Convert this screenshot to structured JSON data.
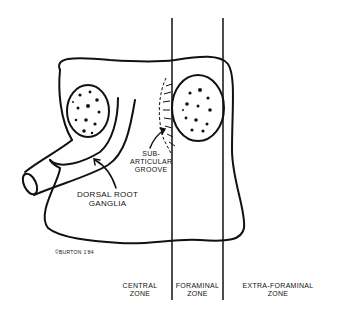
{
  "figure": {
    "labels": {
      "sub_articular_groove_line1": "Sub-",
      "sub_articular_groove_line2": "Articular",
      "sub_articular_groove_line3": "Groove",
      "dorsal_root_ganglia_line1": "Dorsal Root",
      "dorsal_root_ganglia_line2": "Ganglia",
      "copyright": "©Burton 1'84"
    },
    "zones": [
      {
        "line1": "Central",
        "line2": "Zone"
      },
      {
        "line1": "Foraminal",
        "line2": "Zone"
      },
      {
        "line1": "Extra-Foraminal",
        "line2": "Zone"
      }
    ],
    "stroke_color": "#111111",
    "background": "#ffffff"
  }
}
